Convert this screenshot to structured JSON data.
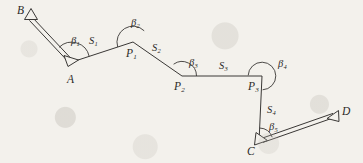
{
  "figure": {
    "background_color": "#f3f1ec",
    "line_color": "#3a3836",
    "label_color": "#2b2a28"
  },
  "stations": [
    {
      "id": "B",
      "label": "B",
      "sub": "",
      "marker": "triangle",
      "x": 31,
      "y": 14,
      "label_x": 17,
      "label_y": 5
    },
    {
      "id": "A",
      "label": "A",
      "sub": "",
      "marker": "triangle",
      "x": 72,
      "y": 62,
      "label_x": 67,
      "label_y": 74
    },
    {
      "id": "P1",
      "label": "P",
      "sub": "1",
      "marker": "vertex",
      "x": 133,
      "y": 42,
      "label_x": 126,
      "label_y": 48
    },
    {
      "id": "P2",
      "label": "P",
      "sub": "2",
      "marker": "vertex",
      "x": 182,
      "y": 76,
      "label_x": 174,
      "label_y": 81
    },
    {
      "id": "P3",
      "label": "P",
      "sub": "3",
      "marker": "vertex",
      "x": 262,
      "y": 76,
      "label_x": 248,
      "label_y": 81
    },
    {
      "id": "C",
      "label": "C",
      "sub": "",
      "marker": "triangle",
      "x": 259,
      "y": 142,
      "label_x": 247,
      "label_y": 146
    },
    {
      "id": "D",
      "label": "D",
      "sub": "",
      "marker": "triangle",
      "x": 334,
      "y": 116,
      "label_x": 342,
      "label_y": 106
    }
  ],
  "segments": [
    {
      "id": "BA",
      "label": "",
      "sub": "",
      "style": "double",
      "from": "B",
      "to": "A"
    },
    {
      "id": "S1",
      "label": "S",
      "sub": "1",
      "style": "single",
      "from": "A",
      "to": "P1",
      "label_x": 89,
      "label_y": 36
    },
    {
      "id": "S2",
      "label": "S",
      "sub": "2",
      "style": "single",
      "from": "P1",
      "to": "P2",
      "label_x": 152,
      "label_y": 43
    },
    {
      "id": "S3",
      "label": "S",
      "sub": "3",
      "style": "single",
      "from": "P2",
      "to": "P3",
      "label_x": 219,
      "label_y": 61
    },
    {
      "id": "S4",
      "label": "S",
      "sub": "4",
      "style": "single",
      "from": "P3",
      "to": "C",
      "label_x": 267,
      "label_y": 105
    },
    {
      "id": "CD",
      "label": "",
      "sub": "",
      "style": "double",
      "from": "C",
      "to": "D"
    }
  ],
  "angles": [
    {
      "id": "b1",
      "label": "β",
      "sub": "1",
      "at": "A",
      "label_x": 71,
      "label_y": 36
    },
    {
      "id": "b2",
      "label": "β",
      "sub": "2",
      "at": "P1",
      "label_x": 131,
      "label_y": 18
    },
    {
      "id": "b3",
      "label": "β",
      "sub": "3",
      "at": "P2",
      "label_x": 189,
      "label_y": 58
    },
    {
      "id": "b4",
      "label": "β",
      "sub": "4",
      "at": "P3",
      "label_x": 278,
      "label_y": 59
    },
    {
      "id": "b5",
      "label": "β",
      "sub": "5",
      "at": "C",
      "label_x": 269,
      "label_y": 122
    }
  ]
}
